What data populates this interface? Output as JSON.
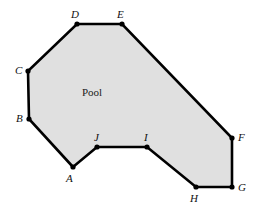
{
  "figure": {
    "width": 260,
    "height": 209,
    "background_color": "#ffffff",
    "region_label": "Pool",
    "region_label_pos": {
      "x": 82,
      "y": 87
    },
    "fill_color": "#e0e0e0",
    "stroke_color": "#000000",
    "stroke_width": 2.6,
    "vertex_dot_color": "#000000",
    "vertex_dot_radius": 2.6,
    "polygon_path": "M 73,167 L 29,119 L 28,71 L 77,24 L 122,24 L 232,138 L 232,187 L 196,187 L 147,147 L 97,147 Z",
    "vertices": [
      {
        "label": "A",
        "x": 73,
        "y": 167,
        "label_x": 66,
        "label_y": 173
      },
      {
        "label": "B",
        "x": 29,
        "y": 119,
        "label_x": 16,
        "label_y": 113
      },
      {
        "label": "C",
        "x": 28,
        "y": 71,
        "label_x": 15,
        "label_y": 65
      },
      {
        "label": "D",
        "x": 77,
        "y": 24,
        "label_x": 71,
        "label_y": 9
      },
      {
        "label": "E",
        "x": 122,
        "y": 24,
        "label_x": 117,
        "label_y": 9
      },
      {
        "label": "F",
        "x": 232,
        "y": 138,
        "label_x": 238,
        "label_y": 132
      },
      {
        "label": "G",
        "x": 232,
        "y": 187,
        "label_x": 238,
        "label_y": 182
      },
      {
        "label": "H",
        "x": 196,
        "y": 187,
        "label_x": 190,
        "label_y": 193
      },
      {
        "label": "I",
        "x": 147,
        "y": 147,
        "label_x": 144,
        "label_y": 132
      },
      {
        "label": "J",
        "x": 97,
        "y": 147,
        "label_x": 94,
        "label_y": 132
      }
    ]
  }
}
